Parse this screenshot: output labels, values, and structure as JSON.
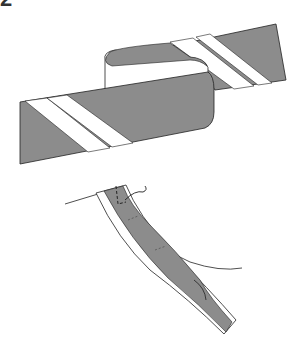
{
  "figure": {
    "step_number": "2",
    "colors": {
      "tape_fill": "#8c8c8c",
      "stripe": "#ffffff",
      "outline": "#222222",
      "background": "#ffffff"
    },
    "panels": [
      {
        "name": "folded-bias-strip"
      },
      {
        "name": "bias-binding-curve"
      }
    ]
  }
}
